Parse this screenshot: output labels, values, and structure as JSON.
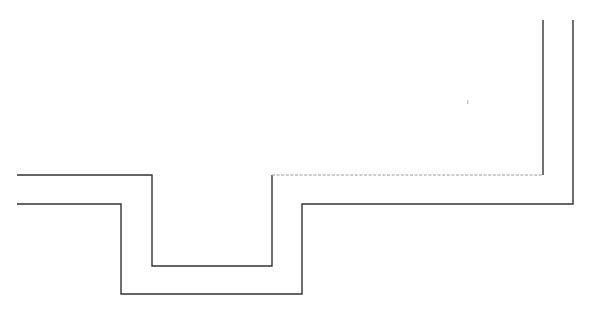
{
  "figure": {
    "background_color": "#ffffff",
    "width": 591,
    "height": 313,
    "line_color": "#333333",
    "dashed_line_color": "#9a9a9a",
    "stroke_width": 1.4,
    "dash_pattern": "3 1.6"
  },
  "geometry": {
    "inner_profile": {
      "name": "inner-stepped-profile",
      "stroke": "#333333",
      "stroke_width": 1.4,
      "style": "solid",
      "points": "17,175 152,175 152,266 272,266 272,175",
      "vertices": [
        {
          "x": 17,
          "y": 175
        },
        {
          "x": 152,
          "y": 175
        },
        {
          "x": 152,
          "y": 266
        },
        {
          "x": 272,
          "y": 266
        },
        {
          "x": 272,
          "y": 175
        }
      ]
    },
    "inner_riser": {
      "name": "inner-right-riser",
      "stroke": "#333333",
      "stroke_width": 1.4,
      "style": "solid",
      "points": "543,175 543,20",
      "vertices": [
        {
          "x": 543,
          "y": 175
        },
        {
          "x": 543,
          "y": 20
        }
      ]
    },
    "hidden_edge": {
      "name": "hidden-reference-edge",
      "stroke": "#9a9a9a",
      "stroke_width": 1.2,
      "style": "dashed",
      "dash_pattern": "3 1.6",
      "points": "272,175 543,175",
      "vertices": [
        {
          "x": 272,
          "y": 175
        },
        {
          "x": 543,
          "y": 175
        }
      ]
    },
    "outer_profile": {
      "name": "outer-stepped-profile",
      "stroke": "#333333",
      "stroke_width": 1.4,
      "style": "solid",
      "points": "17,204 121,204 121,294 302,294 302,204 573,204 573,20",
      "vertices": [
        {
          "x": 17,
          "y": 204
        },
        {
          "x": 121,
          "y": 204
        },
        {
          "x": 121,
          "y": 294
        },
        {
          "x": 302,
          "y": 294
        },
        {
          "x": 302,
          "y": 204
        },
        {
          "x": 573,
          "y": 204
        },
        {
          "x": 573,
          "y": 20
        }
      ]
    },
    "artifact_speck": {
      "name": "scan-artifact-speck",
      "fill": "#c8c8c8",
      "x": 467,
      "y": 100,
      "width": 1.4,
      "height": 4
    }
  }
}
